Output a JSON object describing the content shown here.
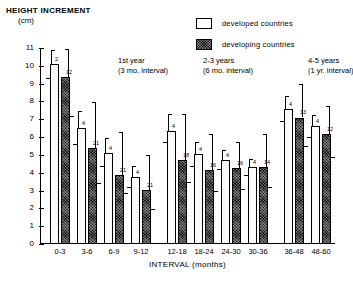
{
  "chart_data": {
    "type": "bar",
    "title": "",
    "ylabel": "HEIGHT INCREMENT",
    "yunit": "(cm)",
    "xlabel": "INTERVAL (months)",
    "ylim": [
      0,
      11
    ],
    "yticks": [
      0,
      1,
      2,
      3,
      4,
      5,
      6,
      7,
      8,
      9,
      10,
      11
    ],
    "ytick_labels": [
      "0",
      "1",
      "2",
      "3",
      "4",
      "5",
      "6",
      "7",
      "8",
      "9",
      "10",
      "11"
    ],
    "grid": false,
    "legend_position": "top-right",
    "categories": [
      "0-3",
      "3-6",
      "6-9",
      "9-12",
      "12-18",
      "18-24",
      "24-30",
      "30-36",
      "36-48",
      "48-60"
    ],
    "series": [
      {
        "name": "developed countries",
        "values": [
          10.1,
          6.5,
          5.1,
          3.75,
          6.35,
          5.05,
          4.7,
          4.3,
          7.55,
          6.6
        ],
        "n": [
          "2",
          "4",
          "4",
          "4",
          "4",
          "4",
          "4",
          "4",
          "4",
          "4"
        ],
        "range_high": [
          10.9,
          7.45,
          5.95,
          4.4,
          7.3,
          5.7,
          5.3,
          4.75,
          8.3,
          7.25
        ],
        "range_low": [
          9.3,
          5.6,
          4.4,
          3.2,
          5.75,
          4.4,
          4.2,
          3.9,
          6.9,
          6.0
        ]
      },
      {
        "name": "developing countries",
        "values": [
          9.4,
          5.4,
          3.85,
          3.05,
          4.7,
          4.15,
          4.25,
          4.3,
          7.1,
          6.2
        ],
        "n": [
          "12",
          "21",
          "21",
          "21",
          "18",
          "16",
          "16",
          "14",
          "13",
          "12"
        ],
        "range_high": [
          10.95,
          7.95,
          6.3,
          5.0,
          7.3,
          6.2,
          5.7,
          6.15,
          9.0,
          7.75
        ],
        "range_low": [
          7.2,
          3.45,
          2.85,
          1.95,
          3.5,
          3.0,
          3.1,
          3.2,
          5.5,
          4.9
        ]
      }
    ],
    "group_annotations": [
      {
        "line1": "1st year",
        "line2": "(3 mo. interval)",
        "x": 78
      },
      {
        "line1": "2-3 years",
        "line2": "(6 mo. interval)",
        "x": 163
      },
      {
        "line1": "4-5 years",
        "line2": "(1 yr. interval)",
        "x": 268
      }
    ]
  },
  "legend": {
    "items": [
      {
        "label": "developed  countries",
        "key": "developed"
      },
      {
        "label": "developing  countries",
        "key": "developing"
      }
    ]
  }
}
